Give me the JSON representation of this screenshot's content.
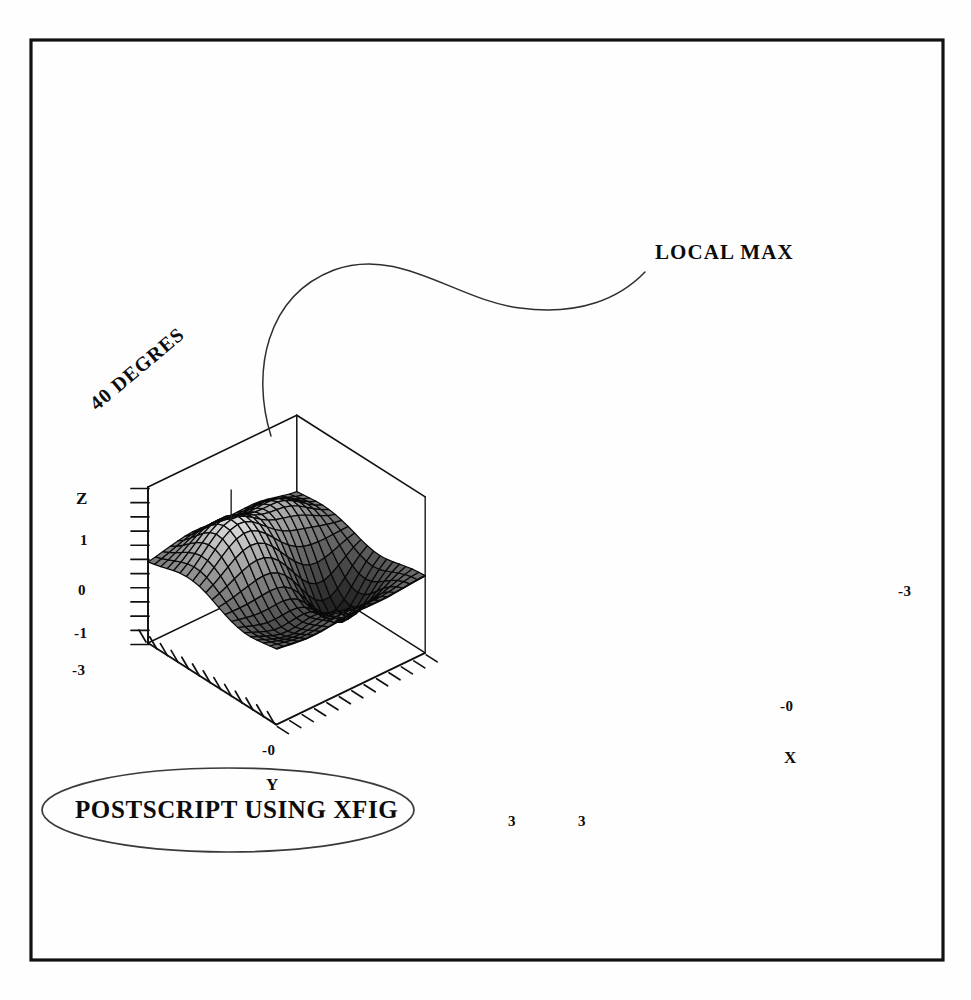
{
  "figure": {
    "title_annotation": "LOCAL MAX",
    "rotation_annotation": "40 DEGRES",
    "caption_oval": "POSTSCRIPT USING XFIG",
    "frame_color": "#111111",
    "ink_color": "#101010",
    "paper_color": "#fefefe"
  },
  "axes": {
    "x": {
      "name": "X",
      "ticks": [
        "-3",
        "-0",
        "3"
      ]
    },
    "y": {
      "name": "Y",
      "ticks": [
        "-3",
        "-0",
        "3"
      ]
    },
    "z": {
      "name": "Z",
      "ticks": [
        "1",
        "0",
        "-1"
      ]
    }
  },
  "labels": {
    "z_name": "Z",
    "z_1": "1",
    "z_0": "0",
    "z_neg1": "-1",
    "y_neg3": "-3",
    "y_neg0": "-0",
    "y_3": "3",
    "y_name": "Y",
    "x_neg3": "-3",
    "x_neg0": "-0",
    "x_3": "3",
    "x_name": "X"
  },
  "chart_data": {
    "type": "surface",
    "title": "",
    "xlabel": "X",
    "ylabel": "Y",
    "zlabel": "Z",
    "xlim": [
      -3,
      3
    ],
    "ylim": [
      -3,
      3
    ],
    "zlim": [
      -1.5,
      1.5
    ],
    "xticks": [
      -3,
      0,
      3
    ],
    "yticks": [
      -3,
      0,
      3
    ],
    "zticks": [
      -1,
      0,
      1
    ],
    "grid": false,
    "legend": null,
    "colormap": "grayscale",
    "mesh_divisions": 20,
    "view_azimuth_deg": 40,
    "view_elevation_deg": 30,
    "annotations": [
      {
        "text": "LOCAL MAX",
        "target": "peak-of-surface",
        "style": "curved-leader-line"
      },
      {
        "text": "40 DEGRES",
        "style": "rotated-text",
        "rotation_deg": -40
      },
      {
        "text": "POSTSCRIPT USING XFIG",
        "style": "ellipse-enclosed"
      }
    ],
    "surface_function": "peaks-like: z = 0.9*exp(-((x+1.1)^2+(y+1.0)^2)/2.6) - 1.05*exp(-((x-1.2)^2+(y-0.9)^2)/1.7) + 0.55*exp(-((x-1.3)^2+(y+1.6)^2)/1.5) - 0.45*exp(-((x+1.5)^2+(y-1.4)^2)/1.9)",
    "features": [
      {
        "name": "local maximum",
        "approx_xyz": [
          -1.1,
          -1.0,
          1.0
        ]
      },
      {
        "name": "local minimum (dark basin)",
        "approx_xyz": [
          1.2,
          0.9,
          -1.05
        ]
      }
    ]
  }
}
